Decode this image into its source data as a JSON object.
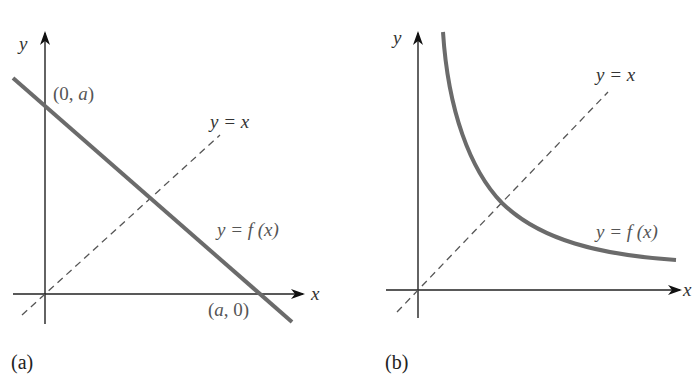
{
  "panels": [
    {
      "id": "a",
      "caption": "(a)",
      "axis_x": "x",
      "axis_y": "y",
      "line_label": "y = f (x)",
      "diagonal_label": "y = x",
      "y_intercept_label": "(0, a)",
      "x_intercept_label": "(a, 0)",
      "curve_type": "decreasing straight line"
    },
    {
      "id": "b",
      "caption": "(b)",
      "axis_x": "x",
      "axis_y": "y",
      "line_label": "y = f (x)",
      "diagonal_label": "y = x",
      "curve_type": "decreasing hyperbola-like curve"
    }
  ],
  "colors": {
    "curve": "#6b6b6b",
    "axis": "#222222",
    "dashed": "#555555",
    "label": "#555555"
  }
}
